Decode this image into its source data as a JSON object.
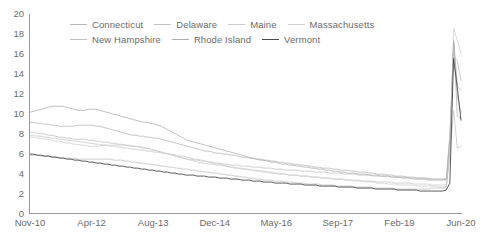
{
  "chart_data": {
    "type": "line",
    "title": "",
    "subtitle": "",
    "xlabel": "",
    "ylabel": "",
    "ylim": [
      0,
      20
    ],
    "yticks": [
      0,
      2,
      4,
      6,
      8,
      10,
      12,
      14,
      16,
      18,
      20
    ],
    "xtick_labels": [
      "Nov-10",
      "Apr-12",
      "Aug-13",
      "Dec-14",
      "May-16",
      "Sep-17",
      "Feb-19",
      "Jun-20"
    ],
    "grid": false,
    "legend_position": "top",
    "x_count": 117,
    "series": [
      {
        "name": "Connecticut",
        "color": "#b9b9b9",
        "values": [
          9.2,
          9.2,
          9.1,
          9.1,
          9.0,
          9.0,
          8.9,
          8.9,
          8.8,
          8.8,
          8.8,
          8.8,
          8.8,
          8.9,
          8.9,
          8.9,
          8.9,
          8.9,
          8.8,
          8.8,
          8.7,
          8.6,
          8.5,
          8.4,
          8.3,
          8.2,
          8.1,
          8.0,
          7.9,
          7.9,
          7.8,
          7.8,
          7.7,
          7.7,
          7.6,
          7.6,
          7.5,
          7.4,
          7.3,
          7.2,
          7.1,
          7.0,
          6.9,
          6.8,
          6.7,
          6.6,
          6.5,
          6.4,
          6.3,
          6.3,
          6.2,
          6.1,
          6.1,
          6.0,
          6.0,
          5.9,
          5.9,
          5.8,
          5.7,
          5.7,
          5.6,
          5.6,
          5.5,
          5.5,
          5.4,
          5.4,
          5.3,
          5.3,
          5.2,
          5.2,
          5.1,
          5.1,
          5.0,
          5.0,
          4.9,
          4.9,
          4.8,
          4.8,
          4.7,
          4.7,
          4.6,
          4.6,
          4.6,
          4.5,
          4.5,
          4.4,
          4.4,
          4.4,
          4.3,
          4.3,
          4.2,
          4.2,
          4.2,
          4.1,
          4.1,
          4.0,
          4.0,
          4.0,
          3.9,
          3.9,
          3.8,
          3.8,
          3.8,
          3.7,
          3.7,
          3.7,
          3.6,
          3.6,
          3.6,
          3.6,
          3.5,
          3.5,
          3.5,
          3.5,
          3.4,
          7.9,
          17.2,
          9.8,
          9.6
        ]
      },
      {
        "name": "Delaware",
        "color": "#c4c4c4",
        "values": [
          8.2,
          8.2,
          8.1,
          8.1,
          8.0,
          7.9,
          7.9,
          7.8,
          7.7,
          7.7,
          7.6,
          7.6,
          7.5,
          7.5,
          7.5,
          7.5,
          7.4,
          7.4,
          7.3,
          7.3,
          7.2,
          7.2,
          7.1,
          7.1,
          7.0,
          7.0,
          6.9,
          6.9,
          6.8,
          6.8,
          6.7,
          6.6,
          6.6,
          6.5,
          6.4,
          6.3,
          6.2,
          6.1,
          6.0,
          5.9,
          5.8,
          5.7,
          5.6,
          5.5,
          5.5,
          5.4,
          5.4,
          5.3,
          5.3,
          5.2,
          5.2,
          5.1,
          5.1,
          5.0,
          5.0,
          4.9,
          4.9,
          4.9,
          4.8,
          4.8,
          4.8,
          4.7,
          4.7,
          4.7,
          4.6,
          4.6,
          4.6,
          4.5,
          4.5,
          4.5,
          4.4,
          4.4,
          4.4,
          4.4,
          4.3,
          4.3,
          4.3,
          4.3,
          4.2,
          4.2,
          4.2,
          4.2,
          4.1,
          4.1,
          4.1,
          4.1,
          4.0,
          4.0,
          4.0,
          4.0,
          3.9,
          3.9,
          3.9,
          3.9,
          3.8,
          3.8,
          3.8,
          3.8,
          3.8,
          3.7,
          3.7,
          3.7,
          3.7,
          3.7,
          3.6,
          3.6,
          3.6,
          3.6,
          3.6,
          3.5,
          3.5,
          3.5,
          3.5,
          3.5,
          3.6,
          8.2,
          15.8,
          15.4,
          13.4
        ]
      },
      {
        "name": "Maine",
        "color": "#cacaca",
        "values": [
          7.9,
          7.9,
          7.8,
          7.8,
          7.7,
          7.7,
          7.6,
          7.6,
          7.5,
          7.5,
          7.4,
          7.4,
          7.3,
          7.3,
          7.2,
          7.2,
          7.1,
          7.1,
          7.0,
          7.0,
          6.9,
          6.9,
          6.8,
          6.8,
          6.7,
          6.7,
          6.6,
          6.6,
          6.5,
          6.5,
          6.4,
          6.4,
          6.3,
          6.3,
          6.2,
          6.2,
          6.1,
          6.1,
          6.0,
          6.0,
          5.9,
          5.8,
          5.8,
          5.7,
          5.6,
          5.5,
          5.5,
          5.4,
          5.3,
          5.2,
          5.1,
          5.0,
          5.0,
          4.9,
          4.8,
          4.7,
          4.6,
          4.6,
          4.5,
          4.5,
          4.4,
          4.4,
          4.3,
          4.3,
          4.2,
          4.2,
          4.1,
          4.1,
          4.0,
          4.0,
          4.0,
          3.9,
          3.9,
          3.9,
          3.8,
          3.8,
          3.8,
          3.7,
          3.7,
          3.7,
          3.6,
          3.6,
          3.6,
          3.5,
          3.5,
          3.5,
          3.5,
          3.4,
          3.4,
          3.4,
          3.4,
          3.3,
          3.3,
          3.3,
          3.3,
          3.2,
          3.2,
          3.2,
          3.2,
          3.2,
          3.1,
          3.1,
          3.1,
          3.1,
          3.1,
          3.0,
          3.0,
          3.0,
          3.0,
          3.0,
          2.9,
          2.9,
          2.9,
          2.9,
          3.0,
          6.4,
          10.4,
          6.6,
          6.8
        ]
      },
      {
        "name": "Massachusetts",
        "color": "#cfcfcf",
        "values": [
          7.7,
          7.7,
          7.6,
          7.6,
          7.5,
          7.5,
          7.4,
          7.3,
          7.3,
          7.2,
          7.1,
          7.1,
          7.0,
          7.0,
          6.9,
          6.9,
          6.8,
          6.8,
          6.8,
          6.8,
          6.9,
          6.9,
          6.9,
          6.9,
          6.9,
          6.9,
          6.9,
          6.8,
          6.8,
          6.8,
          6.7,
          6.7,
          6.6,
          6.5,
          6.4,
          6.3,
          6.2,
          6.1,
          6.0,
          5.9,
          5.8,
          5.7,
          5.6,
          5.5,
          5.4,
          5.3,
          5.2,
          5.1,
          5.1,
          5.0,
          5.0,
          4.9,
          4.9,
          4.8,
          4.8,
          4.7,
          4.7,
          4.6,
          4.6,
          4.5,
          4.5,
          4.4,
          4.4,
          4.3,
          4.3,
          4.2,
          4.2,
          4.1,
          4.1,
          4.0,
          4.0,
          3.9,
          3.9,
          3.9,
          3.8,
          3.8,
          3.8,
          3.7,
          3.7,
          3.7,
          3.6,
          3.6,
          3.6,
          3.5,
          3.5,
          3.5,
          3.4,
          3.4,
          3.4,
          3.3,
          3.3,
          3.3,
          3.2,
          3.2,
          3.2,
          3.1,
          3.1,
          3.1,
          3.0,
          3.0,
          3.0,
          2.9,
          2.9,
          2.9,
          2.9,
          2.9,
          2.8,
          2.8,
          2.8,
          2.8,
          2.8,
          2.8,
          2.7,
          2.7,
          2.8,
          6.8,
          18.6,
          17.4,
          16.1
        ]
      },
      {
        "name": "New Hampshire",
        "color": "#c0c0c0",
        "values": [
          5.9,
          5.9,
          5.9,
          5.8,
          5.8,
          5.8,
          5.7,
          5.7,
          5.7,
          5.6,
          5.6,
          5.6,
          5.6,
          5.5,
          5.5,
          5.5,
          5.5,
          5.5,
          5.5,
          5.5,
          5.5,
          5.5,
          5.5,
          5.4,
          5.4,
          5.4,
          5.3,
          5.3,
          5.2,
          5.2,
          5.1,
          5.1,
          5.0,
          5.0,
          4.9,
          4.9,
          4.8,
          4.8,
          4.7,
          4.7,
          4.6,
          4.6,
          4.5,
          4.5,
          4.4,
          4.4,
          4.3,
          4.3,
          4.2,
          4.2,
          4.1,
          4.1,
          4.0,
          4.0,
          3.9,
          3.9,
          3.8,
          3.8,
          3.7,
          3.7,
          3.6,
          3.6,
          3.5,
          3.5,
          3.4,
          3.4,
          3.4,
          3.3,
          3.3,
          3.3,
          3.2,
          3.2,
          3.2,
          3.1,
          3.1,
          3.1,
          3.0,
          3.0,
          3.0,
          3.0,
          2.9,
          2.9,
          2.9,
          2.9,
          2.8,
          2.8,
          2.8,
          2.8,
          2.8,
          2.7,
          2.7,
          2.7,
          2.7,
          2.7,
          2.6,
          2.6,
          2.6,
          2.6,
          2.6,
          2.6,
          2.5,
          2.5,
          2.5,
          2.5,
          2.5,
          2.5,
          2.5,
          2.5,
          2.5,
          2.5,
          2.6,
          2.6,
          2.6,
          2.6,
          2.7,
          6.2,
          17.1,
          11.8,
          10.1
        ]
      },
      {
        "name": "Rhode Island",
        "color": "#b0b0b0",
        "values": [
          10.2,
          10.3,
          10.4,
          10.5,
          10.6,
          10.7,
          10.8,
          10.8,
          10.8,
          10.8,
          10.7,
          10.6,
          10.5,
          10.4,
          10.4,
          10.4,
          10.5,
          10.5,
          10.5,
          10.4,
          10.3,
          10.2,
          10.1,
          10.0,
          9.9,
          9.8,
          9.7,
          9.6,
          9.5,
          9.4,
          9.3,
          9.2,
          9.2,
          9.1,
          9.0,
          8.9,
          8.8,
          8.6,
          8.4,
          8.2,
          8.0,
          7.8,
          7.6,
          7.4,
          7.3,
          7.2,
          7.1,
          7.0,
          6.9,
          6.8,
          6.7,
          6.6,
          6.5,
          6.4,
          6.3,
          6.2,
          6.1,
          6.0,
          5.9,
          5.8,
          5.7,
          5.6,
          5.5,
          5.4,
          5.4,
          5.3,
          5.2,
          5.2,
          5.1,
          5.0,
          5.0,
          4.9,
          4.9,
          4.8,
          4.8,
          4.7,
          4.7,
          4.6,
          4.6,
          4.5,
          4.5,
          4.4,
          4.4,
          4.3,
          4.3,
          4.2,
          4.2,
          4.1,
          4.1,
          4.1,
          4.0,
          4.0,
          4.0,
          3.9,
          3.9,
          3.9,
          3.8,
          3.8,
          3.8,
          3.7,
          3.7,
          3.7,
          3.6,
          3.6,
          3.6,
          3.5,
          3.5,
          3.5,
          3.5,
          3.4,
          3.4,
          3.4,
          3.4,
          3.4,
          3.5,
          7.6,
          17.4,
          12.8,
          12.4
        ]
      },
      {
        "name": "Vermont",
        "color": "#4a4a4a",
        "values": [
          6.0,
          6.0,
          5.9,
          5.9,
          5.8,
          5.8,
          5.7,
          5.7,
          5.6,
          5.6,
          5.5,
          5.5,
          5.4,
          5.4,
          5.3,
          5.3,
          5.2,
          5.2,
          5.1,
          5.1,
          5.0,
          5.0,
          4.9,
          4.9,
          4.8,
          4.8,
          4.7,
          4.7,
          4.6,
          4.6,
          4.5,
          4.5,
          4.4,
          4.4,
          4.3,
          4.3,
          4.2,
          4.2,
          4.1,
          4.1,
          4.0,
          4.0,
          3.9,
          3.9,
          3.9,
          3.8,
          3.8,
          3.8,
          3.7,
          3.7,
          3.7,
          3.6,
          3.6,
          3.6,
          3.5,
          3.5,
          3.5,
          3.4,
          3.4,
          3.4,
          3.3,
          3.3,
          3.3,
          3.2,
          3.2,
          3.2,
          3.1,
          3.1,
          3.1,
          3.1,
          3.0,
          3.0,
          3.0,
          3.0,
          2.9,
          2.9,
          2.9,
          2.9,
          2.8,
          2.8,
          2.8,
          2.8,
          2.8,
          2.7,
          2.7,
          2.7,
          2.7,
          2.7,
          2.6,
          2.6,
          2.6,
          2.6,
          2.6,
          2.5,
          2.5,
          2.5,
          2.5,
          2.5,
          2.5,
          2.4,
          2.4,
          2.4,
          2.4,
          2.4,
          2.4,
          2.3,
          2.3,
          2.3,
          2.3,
          2.3,
          2.3,
          2.3,
          2.4,
          3.1,
          15.6,
          12.7,
          9.4
        ]
      }
    ]
  },
  "axis": {
    "color": "#9a9a9a"
  }
}
